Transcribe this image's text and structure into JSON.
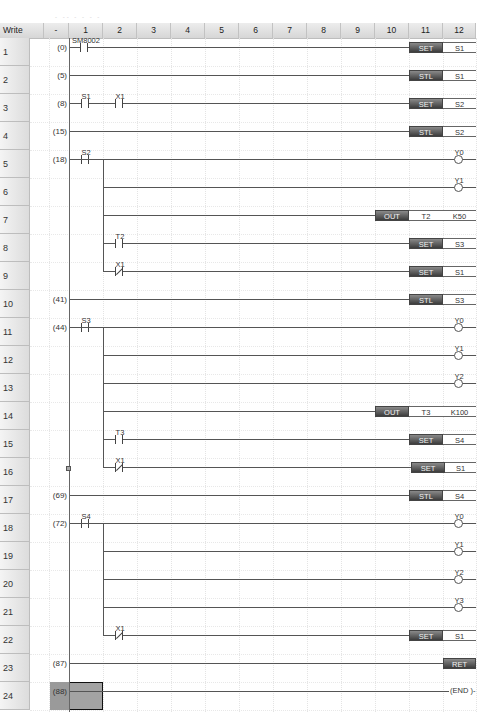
{
  "header": {
    "mode_label": "Write",
    "step_col_label": "-",
    "columns": [
      "1",
      "2",
      "3",
      "4",
      "5",
      "6",
      "7",
      "8",
      "9",
      "10",
      "11",
      "12"
    ]
  },
  "rows": [
    {
      "num": "1",
      "step": "(0)"
    },
    {
      "num": "2",
      "step": "(5)"
    },
    {
      "num": "3",
      "step": "(8)"
    },
    {
      "num": "4",
      "step": "(15)"
    },
    {
      "num": "5",
      "step": "(18)"
    },
    {
      "num": "6",
      "step": ""
    },
    {
      "num": "7",
      "step": ""
    },
    {
      "num": "8",
      "step": ""
    },
    {
      "num": "9",
      "step": ""
    },
    {
      "num": "10",
      "step": "(41)"
    },
    {
      "num": "11",
      "step": "(44)"
    },
    {
      "num": "12",
      "step": ""
    },
    {
      "num": "13",
      "step": ""
    },
    {
      "num": "14",
      "step": ""
    },
    {
      "num": "15",
      "step": ""
    },
    {
      "num": "16",
      "step": ""
    },
    {
      "num": "17",
      "step": "(69)"
    },
    {
      "num": "18",
      "step": "(72)"
    },
    {
      "num": "19",
      "step": ""
    },
    {
      "num": "20",
      "step": ""
    },
    {
      "num": "21",
      "step": ""
    },
    {
      "num": "22",
      "step": ""
    },
    {
      "num": "23",
      "step": "(87)"
    },
    {
      "num": "24",
      "step": "(88)"
    }
  ],
  "contacts": {
    "r1": "SM8002",
    "r3a": "S1",
    "r3b": "X1",
    "r5": "S2",
    "r8": "T2",
    "r9": "X1",
    "r11": "S3",
    "r15": "T3",
    "r16": "X1",
    "r18": "S4",
    "r22": "X1"
  },
  "instructions": {
    "r1": {
      "op": "SET",
      "arg": "S1"
    },
    "r2": {
      "op": "STL",
      "arg": "S1"
    },
    "r3": {
      "op": "SET",
      "arg": "S2"
    },
    "r4": {
      "op": "STL",
      "arg": "S2"
    },
    "r7": {
      "op": "OUT",
      "arg1": "T2",
      "arg2": "K50"
    },
    "r8": {
      "op": "SET",
      "arg": "S3"
    },
    "r9": {
      "op": "SET",
      "arg": "S1"
    },
    "r10": {
      "op": "STL",
      "arg": "S3"
    },
    "r14": {
      "op": "OUT",
      "arg1": "T3",
      "arg2": "K100"
    },
    "r15": {
      "op": "SET",
      "arg": "S4"
    },
    "r16": {
      "op": "SET",
      "arg": "S1"
    },
    "r17": {
      "op": "STL",
      "arg": "S4"
    },
    "r22": {
      "op": "SET",
      "arg": "S1"
    },
    "r23": {
      "op": "RET"
    },
    "r24": {
      "label": "(END )-"
    }
  },
  "coils": {
    "r5": "Y0",
    "r6": "Y1",
    "r11": "Y0",
    "r12": "Y1",
    "r13": "Y2",
    "r18": "Y0",
    "r19": "Y1",
    "r20": "Y2",
    "r21": "Y3"
  },
  "colors": {
    "instruction_dark": "#3c3c3c",
    "instruction_light": "#8a8a8a",
    "wire": "#555555",
    "cursor": "#9a9a9a"
  }
}
